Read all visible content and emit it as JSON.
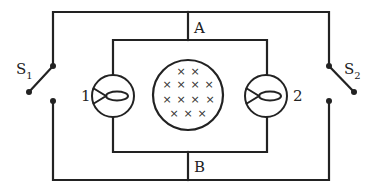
{
  "diagram": {
    "type": "circuit",
    "line_color": "#222222",
    "background": "#ffffff",
    "labels": {
      "node_top": "A",
      "node_bottom": "B",
      "switch_left": {
        "main": "S",
        "sub": "1"
      },
      "switch_right": {
        "main": "S",
        "sub": "2"
      },
      "bulb_left": "1",
      "bulb_right": "2"
    },
    "components": [
      {
        "id": "S1",
        "kind": "switch",
        "state": "open",
        "position": "left branch"
      },
      {
        "id": "S2",
        "kind": "switch",
        "state": "open",
        "position": "right branch"
      },
      {
        "id": "1",
        "kind": "lamp",
        "position": "inner left"
      },
      {
        "id": "2",
        "kind": "lamp",
        "position": "inner right"
      },
      {
        "id": "field",
        "kind": "magnetic-field-region",
        "direction": "into page",
        "cross_count": 13,
        "rows": [
          2,
          4,
          4,
          3
        ]
      }
    ],
    "nodes": [
      "A",
      "B"
    ]
  }
}
